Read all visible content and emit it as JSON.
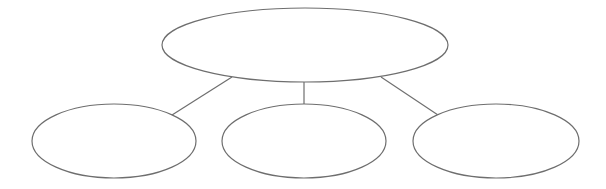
{
  "diagram": {
    "type": "hierarchy",
    "root": {
      "id": "root",
      "label": ""
    },
    "children": [
      {
        "id": "child-left",
        "label": ""
      },
      {
        "id": "child-middle",
        "label": ""
      },
      {
        "id": "child-right",
        "label": ""
      }
    ],
    "edges": [
      {
        "from": "root",
        "to": "child-left"
      },
      {
        "from": "root",
        "to": "child-middle"
      },
      {
        "from": "root",
        "to": "child-right"
      }
    ],
    "stroke_color": "#6e6e6e"
  }
}
